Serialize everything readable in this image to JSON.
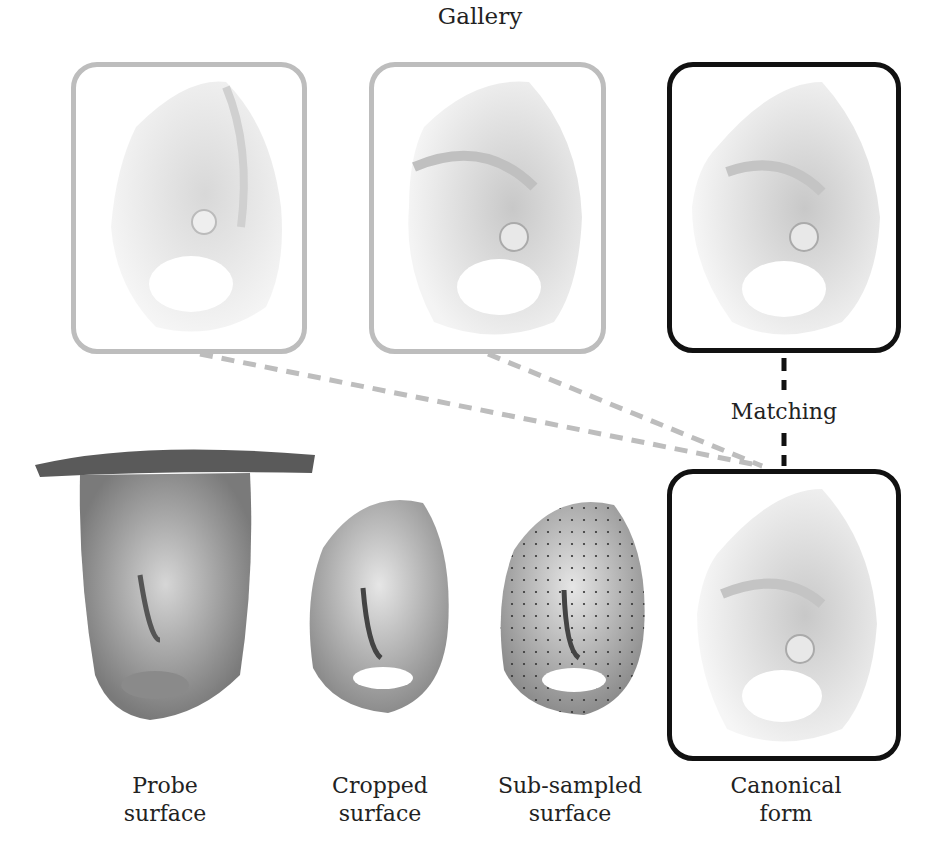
{
  "gallery": {
    "title": "Gallery",
    "items": [
      {
        "name": "gallery-canonical-form-1",
        "border": "gray"
      },
      {
        "name": "gallery-canonical-form-2",
        "border": "gray"
      },
      {
        "name": "gallery-canonical-form-3",
        "border": "black"
      }
    ]
  },
  "matching_label": "Matching",
  "pipeline": [
    {
      "line1": "Probe",
      "line2": "surface"
    },
    {
      "line1": "Cropped",
      "line2": "surface"
    },
    {
      "line1": "Sub-sampled",
      "line2": "surface"
    },
    {
      "line1": "Canonical",
      "line2": "form"
    }
  ],
  "colors": {
    "gray_border": "#bdbdbd",
    "black_border": "#111111",
    "dashed_gray": "#bdbdbd",
    "dashed_black": "#111111"
  }
}
